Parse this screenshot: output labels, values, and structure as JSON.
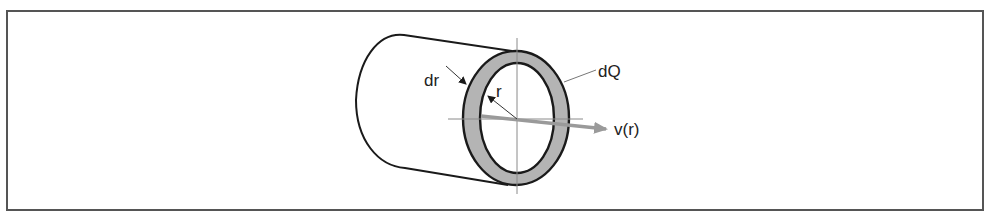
{
  "figure": {
    "labels": {
      "dr": "dr",
      "r": "r",
      "dQ": "dQ",
      "velocity": "v(r)"
    },
    "colors": {
      "frame": "#555555",
      "outline": "#1a1a1a",
      "annulus_fill": "#b4b4b4",
      "axis": "#8a8a8a",
      "velocity_arrow": "#9a9a9a",
      "text": "#222222"
    }
  }
}
